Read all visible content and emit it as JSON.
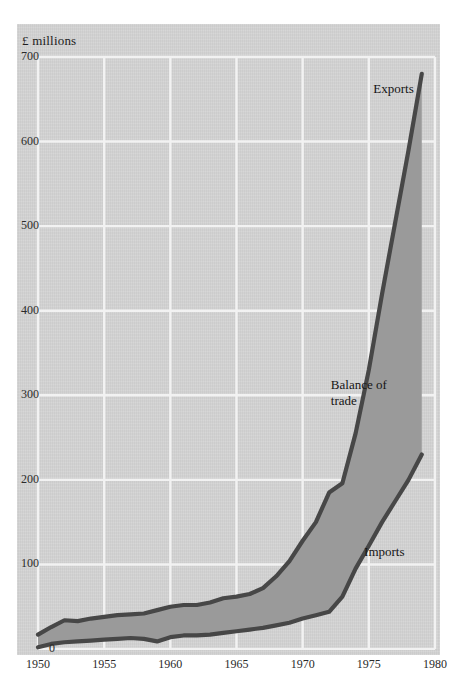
{
  "chart_data": {
    "type": "area",
    "title": "",
    "subtitle": "",
    "unit_label": "£ millions",
    "xlabel": "",
    "ylabel": "£ millions",
    "xlim": [
      1950,
      1980
    ],
    "ylim": [
      0,
      700
    ],
    "xticks": [
      1950,
      1955,
      1960,
      1965,
      1970,
      1975,
      1980
    ],
    "yticks": [
      0,
      100,
      200,
      300,
      400,
      500,
      600,
      700
    ],
    "grid": true,
    "legend_position": "inline-annotations",
    "annotations": [
      {
        "text": "Exports",
        "value_near": 660,
        "year_near": 1977
      },
      {
        "text": "Balance of trade",
        "value_near": 300,
        "year_near": 1975
      },
      {
        "text": "Imports",
        "value_near": 110,
        "year_near": 1976
      }
    ],
    "series": [
      {
        "name": "Exports",
        "x": [
          1950,
          1951,
          1952,
          1953,
          1954,
          1955,
          1956,
          1957,
          1958,
          1959,
          1960,
          1961,
          1962,
          1963,
          1964,
          1965,
          1966,
          1967,
          1968,
          1969,
          1970,
          1971,
          1972,
          1973,
          1974,
          1975,
          1976,
          1977,
          1978,
          1979
        ],
        "values": [
          17,
          26,
          34,
          33,
          36,
          38,
          40,
          41,
          42,
          46,
          50,
          52,
          52,
          55,
          60,
          62,
          65,
          72,
          86,
          104,
          128,
          150,
          185,
          196,
          255,
          330,
          420,
          505,
          590,
          680
        ]
      },
      {
        "name": "Imports",
        "x": [
          1950,
          1951,
          1952,
          1953,
          1954,
          1955,
          1956,
          1957,
          1958,
          1959,
          1960,
          1961,
          1962,
          1963,
          1964,
          1965,
          1966,
          1967,
          1968,
          1969,
          1970,
          1971,
          1972,
          1973,
          1974,
          1975,
          1976,
          1977,
          1978,
          1979
        ],
        "values": [
          2,
          6,
          8,
          9,
          10,
          11,
          12,
          13,
          12,
          9,
          14,
          16,
          16,
          17,
          19,
          21,
          23,
          25,
          28,
          31,
          36,
          40,
          44,
          62,
          95,
          122,
          150,
          175,
          200,
          230
        ]
      }
    ],
    "band": {
      "name": "Balance of trade",
      "description": "shaded area between Exports (upper) and Imports (lower)"
    },
    "colors": {
      "background": "#d3d3d3",
      "band_fill": "#9a9a9a",
      "line": "#474747",
      "grid": "#f2f2f2",
      "text": "#1c1c1c"
    }
  }
}
